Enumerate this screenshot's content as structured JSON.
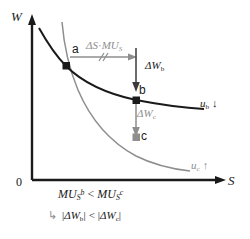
{
  "figure": {
    "type": "economics-indifference-curve-diagram",
    "axes": {
      "y_label": "W",
      "x_label": "S",
      "origin_label": "0"
    },
    "points": [
      {
        "id": "a",
        "label": "a",
        "color": "#1a1a1a",
        "shape": "filled-square"
      },
      {
        "id": "b",
        "label": "b",
        "color": "#1a1a1a",
        "shape": "filled-square"
      },
      {
        "id": "c",
        "label": "c",
        "color": "#8e8e8e",
        "shape": "filled-square"
      }
    ],
    "curves": [
      {
        "id": "ub",
        "label_text": "u",
        "label_sub": "b",
        "label_arrow": "↓",
        "color": "#1a1a1a"
      },
      {
        "id": "uc",
        "label_text": "u",
        "label_sub": "c",
        "label_arrow": "↑",
        "color": "#8e8e8e"
      }
    ],
    "annotations": {
      "horizontal_arrow": {
        "delta": "Δ",
        "var": "S",
        "dot": "·",
        "mu": "MU",
        "mu_sub": "S"
      },
      "delta_w_b": {
        "delta": "Δ",
        "var": "W",
        "sub": "b"
      },
      "delta_w_c": {
        "delta": "Δ",
        "var": "W",
        "sub": "c"
      }
    },
    "captions": {
      "line1": {
        "mu": "MU",
        "sub": "S",
        "sup_left": "b",
        "relation": "<",
        "sup_right": "c"
      },
      "line2": {
        "hook": "↳",
        "delta": "Δ",
        "var": "W",
        "sub_left": "b",
        "sub_right": "c",
        "relation": "<",
        "bar": "|"
      }
    },
    "colors": {
      "black": "#1a1a1a",
      "gray": "#8e8e8e",
      "light_gray": "#a8a8a8",
      "background": "#ffffff"
    }
  }
}
